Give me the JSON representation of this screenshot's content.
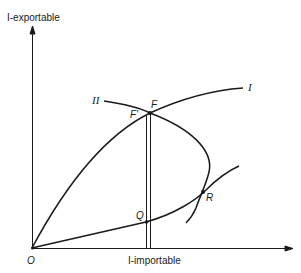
{
  "axes": {
    "y_label": "I-exportable",
    "x_label": "I-importable",
    "origin_label": "O"
  },
  "curves": {
    "curve_I_label": "I",
    "curve_II_label": "II"
  },
  "points": {
    "F": "F",
    "F_prime": "F'",
    "Q": "Q",
    "R": "R"
  },
  "colors": {
    "ink": "#1a1a1a",
    "background": "#ffffff"
  }
}
